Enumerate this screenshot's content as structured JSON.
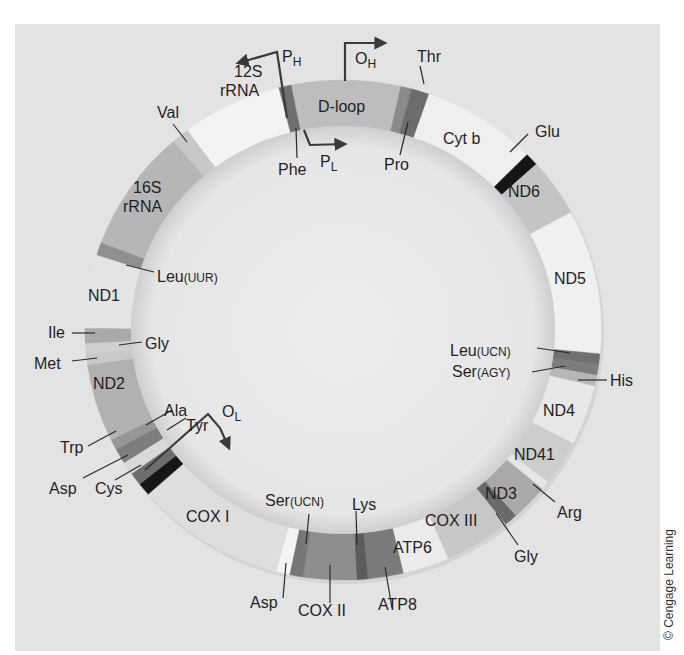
{
  "colors": {
    "panel": "#e3e3e3",
    "inner_disc": "#e9e9e9",
    "ring_shadow": "#b8b8b8",
    "text": "#1f1f1f"
  },
  "ring": {
    "cx": 343,
    "cy": 330,
    "rx_out": 258,
    "ry_out": 250,
    "thickness": 46
  },
  "segments": [
    {
      "name": "Phe",
      "start": 345.5,
      "end": 348.5,
      "color": "#6f6f6f"
    },
    {
      "name": "D-loop",
      "start": 348.5,
      "end": 373.0,
      "color": "#bdbdbd"
    },
    {
      "name": "Pro",
      "start": 373.0,
      "end": 375.5,
      "color": "#8a8a8a"
    },
    {
      "name": "Thr",
      "start": 375.5,
      "end": 379.5,
      "color": "#6c6c6c"
    },
    {
      "name": "Cyt b",
      "start": 379.5,
      "end": 405.5,
      "color": "#efefef"
    },
    {
      "name": "Glu",
      "start": 405.5,
      "end": 408.5,
      "color": "#151515"
    },
    {
      "name": "ND6",
      "start": 408.5,
      "end": 422.0,
      "color": "#c4c4c4"
    },
    {
      "name": "ND5",
      "start": 422.0,
      "end": 455.5,
      "color": "#f0f0f0"
    },
    {
      "name": "Leu(UCN)",
      "start": 455.5,
      "end": 458.0,
      "color": "#707070"
    },
    {
      "name": "Ser(AGY)",
      "start": 458.0,
      "end": 460.5,
      "color": "#7c7c7c"
    },
    {
      "name": "His",
      "start": 460.5,
      "end": 463.0,
      "color": "#b6b6b6"
    },
    {
      "name": "ND4",
      "start": 463.0,
      "end": 477.0,
      "color": "#e8e8e8"
    },
    {
      "name": "ND41",
      "start": 477.0,
      "end": 487.5,
      "color": "#cdcdcd"
    },
    {
      "name": "Arg",
      "start": 487.5,
      "end": 489.5,
      "color": "#e6e6e6"
    },
    {
      "name": "ND3",
      "start": 489.5,
      "end": 498.0,
      "color": "#a9a9a9"
    },
    {
      "name": "Gly",
      "start": 498.0,
      "end": 501.0,
      "color": "#6a6a6a"
    },
    {
      "name": "COX III",
      "start": 501.0,
      "end": 516.0,
      "color": "#c7c7c7"
    },
    {
      "name": "ATP6",
      "start": 516.0,
      "end": 526.5,
      "color": "#ebebeb"
    },
    {
      "name": "ATP8",
      "start": 526.5,
      "end": 534.5,
      "color": "#7b7b7b"
    },
    {
      "name": "Lys",
      "start": 534.5,
      "end": 537.0,
      "color": "#5c5c5c"
    },
    {
      "name": "COX II",
      "start": 537.0,
      "end": 549.0,
      "color": "#8e8e8e"
    },
    {
      "name": "Ser(UCN)",
      "start": 549.0,
      "end": 552.0,
      "color": "#767676"
    },
    {
      "name": "Asp",
      "start": 552.0,
      "end": 555.0,
      "color": "#f4f4f4"
    },
    {
      "name": "COX I",
      "start": 555.0,
      "end": 589.0,
      "color": "#dedede"
    },
    {
      "name": "Tyr",
      "start": 589.0,
      "end": 592.0,
      "color": "#161616"
    },
    {
      "name": "Cys",
      "start": 592.0,
      "end": 595.0,
      "color": "#6d6d6d"
    },
    {
      "name": "Asp-gap",
      "start": 595.0,
      "end": 598.0,
      "color": "#d9d9d9"
    },
    {
      "name": "Trp",
      "start": 598.0,
      "end": 601.5,
      "color": "#7d7d7d"
    },
    {
      "name": "Ala",
      "start": 601.5,
      "end": 604.0,
      "color": "#969696"
    },
    {
      "name": "ND2",
      "start": 604.0,
      "end": 622.0,
      "color": "#b1b1b1"
    },
    {
      "name": "Met",
      "start": 622.0,
      "end": 624.5,
      "color": "#c9c9c9"
    },
    {
      "name": "Gly-tRNA",
      "start": 624.5,
      "end": 627.0,
      "color": "#cfcfcf"
    },
    {
      "name": "Ile",
      "start": 627.0,
      "end": 630.5,
      "color": "#aaaaaa"
    },
    {
      "name": "ND1",
      "start": 630.5,
      "end": 647.5,
      "color": "#e4e4e4"
    },
    {
      "name": "Leu(UUR)",
      "start": 647.5,
      "end": 650.5,
      "color": "#8f8f8f"
    },
    {
      "name": "16S rRNA",
      "start": 650.5,
      "end": 679.0,
      "color": "#b6b6b6"
    },
    {
      "name": "Val",
      "start": 679.0,
      "end": 683.0,
      "color": "#c8c8c8"
    },
    {
      "name": "12S rRNA",
      "start": 683.0,
      "end": 705.5,
      "color": "#f3f3f3"
    }
  ],
  "labels": {
    "d_loop": "D-loop",
    "rrna12_a": "12S",
    "rrna12_b": "rRNA",
    "rrna16_a": "16S",
    "rrna16_b": "rRNA",
    "val": "Val",
    "phe": "Phe",
    "pro": "Pro",
    "thr": "Thr",
    "cyt_b": "Cyt b",
    "glu": "Glu",
    "nd6": "ND6",
    "nd5": "ND5",
    "leu_ucn": "Leu",
    "leu_ucn_sub": "(UCN)",
    "ser_agy": "Ser",
    "ser_agy_sub": "(AGY)",
    "his": "His",
    "nd4": "ND4",
    "nd41": "ND41",
    "arg": "Arg",
    "nd3": "ND3",
    "gly_right": "Gly",
    "cox3": "COX III",
    "atp6": "ATP6",
    "atp8": "ATP8",
    "lys": "Lys",
    "ser_ucn": "Ser",
    "ser_ucn_sub": "(UCN)",
    "cox2": "COX II",
    "asp_bottom": "Asp",
    "cox1": "COX I",
    "tyr": "Tyr",
    "cys": "Cys",
    "asp_left": "Asp",
    "trp": "Trp",
    "ala": "Ala",
    "nd2": "ND2",
    "met": "Met",
    "gly_left": "Gly",
    "ile": "Ile",
    "nd1": "ND1",
    "leu_uur": "Leu",
    "leu_uur_sub": "(UUR)"
  },
  "markers": {
    "ph": {
      "main": "P",
      "sub": "H"
    },
    "pl": {
      "main": "P",
      "sub": "L"
    },
    "oh": {
      "main": "O",
      "sub": "H"
    },
    "ol": {
      "main": "O",
      "sub": "L"
    }
  },
  "credit": "© Cengage Learning"
}
